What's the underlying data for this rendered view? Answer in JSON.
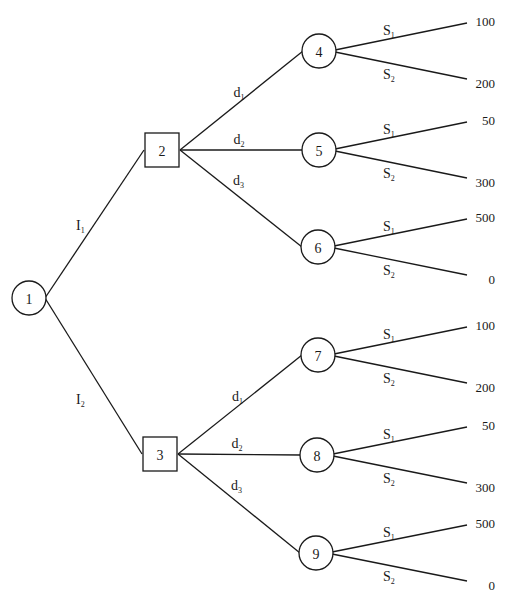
{
  "diagram": {
    "type": "decision-tree",
    "nodes": [
      {
        "id": "1",
        "label": "1",
        "shape": "circle",
        "x": 29,
        "y": 298
      },
      {
        "id": "2",
        "label": "2",
        "shape": "square",
        "x": 162,
        "y": 150
      },
      {
        "id": "3",
        "label": "3",
        "shape": "square",
        "x": 160,
        "y": 454
      },
      {
        "id": "4",
        "label": "4",
        "shape": "circle",
        "x": 319,
        "y": 51
      },
      {
        "id": "5",
        "label": "5",
        "shape": "circle",
        "x": 319,
        "y": 150
      },
      {
        "id": "6",
        "label": "6",
        "shape": "circle",
        "x": 318,
        "y": 247
      },
      {
        "id": "7",
        "label": "7",
        "shape": "circle",
        "x": 318,
        "y": 355
      },
      {
        "id": "8",
        "label": "8",
        "shape": "circle",
        "x": 317,
        "y": 455
      },
      {
        "id": "9",
        "label": "9",
        "shape": "circle",
        "x": 316,
        "y": 553
      }
    ],
    "edges": [
      {
        "from": "1",
        "to": "2",
        "label": "I",
        "sub": "1"
      },
      {
        "from": "1",
        "to": "3",
        "label": "I",
        "sub": "2"
      },
      {
        "from": "2",
        "to": "4",
        "label": "d",
        "sub": "1"
      },
      {
        "from": "2",
        "to": "5",
        "label": "d",
        "sub": "2"
      },
      {
        "from": "2",
        "to": "6",
        "label": "d",
        "sub": "3"
      },
      {
        "from": "3",
        "to": "7",
        "label": "d",
        "sub": "1"
      },
      {
        "from": "3",
        "to": "8",
        "label": "d",
        "sub": "2"
      },
      {
        "from": "3",
        "to": "9",
        "label": "d",
        "sub": "3"
      }
    ],
    "payoffs": [
      {
        "node": "4",
        "branches": [
          {
            "label": "S",
            "sub": "1",
            "value": "100"
          },
          {
            "label": "S",
            "sub": "2",
            "value": "200"
          }
        ]
      },
      {
        "node": "5",
        "branches": [
          {
            "label": "S",
            "sub": "1",
            "value": "50"
          },
          {
            "label": "S",
            "sub": "2",
            "value": "300"
          }
        ]
      },
      {
        "node": "6",
        "branches": [
          {
            "label": "S",
            "sub": "1",
            "value": "500"
          },
          {
            "label": "S",
            "sub": "2",
            "value": "0"
          }
        ]
      },
      {
        "node": "7",
        "branches": [
          {
            "label": "S",
            "sub": "1",
            "value": "100"
          },
          {
            "label": "S",
            "sub": "2",
            "value": "200"
          }
        ]
      },
      {
        "node": "8",
        "branches": [
          {
            "label": "S",
            "sub": "1",
            "value": "50"
          },
          {
            "label": "S",
            "sub": "2",
            "value": "300"
          }
        ]
      },
      {
        "node": "9",
        "branches": [
          {
            "label": "S",
            "sub": "1",
            "value": "500"
          },
          {
            "label": "S",
            "sub": "2",
            "value": "0"
          }
        ]
      }
    ]
  }
}
